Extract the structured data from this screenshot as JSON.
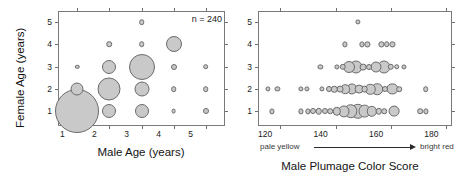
{
  "figure": {
    "background": "#ffffff",
    "bubble_fill": "#c9c9c9",
    "bubble_stroke": "#6b6b6b",
    "axis_color": "#7a7a7a"
  },
  "chart_data": [
    {
      "panel": "left",
      "type": "scatter",
      "bubble": true,
      "title": "",
      "xlabel": "Male Age (years)",
      "ylabel": "Female Age (years)",
      "xlim": [
        0.4,
        5.6
      ],
      "ylim": [
        0.35,
        5.5
      ],
      "xticks": [
        1,
        2,
        3,
        4,
        5
      ],
      "yticks": [
        1,
        2,
        3,
        4,
        5
      ],
      "xticklabels": [
        "1",
        "2",
        "3",
        "4",
        "5"
      ],
      "yticklabels": [
        "1",
        "2",
        "3",
        "4",
        "5"
      ],
      "grid": false,
      "legend": "none",
      "annotations": [
        {
          "text": "n = 240",
          "x": 4.75,
          "y": 5.3
        }
      ],
      "points": [
        {
          "x": 1,
          "y": 1,
          "r": 22.0,
          "n": 58
        },
        {
          "x": 1,
          "y": 2,
          "r": 6.5,
          "n": 6
        },
        {
          "x": 1,
          "y": 3,
          "r": 2.2,
          "n": 1
        },
        {
          "x": 2,
          "y": 1,
          "r": 7.0,
          "n": 7
        },
        {
          "x": 2,
          "y": 2,
          "r": 11.5,
          "n": 18
        },
        {
          "x": 2,
          "y": 3,
          "r": 7.0,
          "n": 7
        },
        {
          "x": 2,
          "y": 4,
          "r": 2.8,
          "n": 1
        },
        {
          "x": 3,
          "y": 1,
          "r": 7.0,
          "n": 7
        },
        {
          "x": 3,
          "y": 2,
          "r": 7.5,
          "n": 8
        },
        {
          "x": 3,
          "y": 3,
          "r": 13.0,
          "n": 22
        },
        {
          "x": 3,
          "y": 4,
          "r": 2.8,
          "n": 1
        },
        {
          "x": 3,
          "y": 5,
          "r": 2.8,
          "n": 1
        },
        {
          "x": 4,
          "y": 1,
          "r": 2.4,
          "n": 1
        },
        {
          "x": 4,
          "y": 2,
          "r": 2.8,
          "n": 1
        },
        {
          "x": 4,
          "y": 3,
          "r": 3.0,
          "n": 2
        },
        {
          "x": 4,
          "y": 4,
          "r": 8.0,
          "n": 9
        },
        {
          "x": 5,
          "y": 1,
          "r": 3.0,
          "n": 2
        },
        {
          "x": 5,
          "y": 2,
          "r": 2.8,
          "n": 1
        },
        {
          "x": 5,
          "y": 3,
          "r": 2.8,
          "n": 1
        }
      ]
    },
    {
      "panel": "right",
      "type": "scatter",
      "bubble": true,
      "title": "",
      "xlabel": "Male Plumage Color Score",
      "ylabel": "",
      "xlim": [
        112,
        182
      ],
      "ylim": [
        0.35,
        5.5
      ],
      "xticks": [
        120,
        140,
        160,
        180
      ],
      "yticks": [
        1,
        2,
        3,
        4,
        5
      ],
      "xticklabels": [
        "120",
        "140",
        "160",
        "180"
      ],
      "yticklabels": [
        "1",
        "2",
        "3",
        "4",
        "5"
      ],
      "grid": false,
      "legend": "none",
      "gradient_legend": {
        "left_label": "pale yellow",
        "right_label": "bright red"
      },
      "points": [
        {
          "x": 148.0,
          "y": 5,
          "r": 2.6
        },
        {
          "x": 143.5,
          "y": 4,
          "r": 2.6
        },
        {
          "x": 149.5,
          "y": 4,
          "r": 2.6
        },
        {
          "x": 151.5,
          "y": 4,
          "r": 2.6
        },
        {
          "x": 156.5,
          "y": 4,
          "r": 2.6
        },
        {
          "x": 158.5,
          "y": 4,
          "r": 2.8
        },
        {
          "x": 160.5,
          "y": 4,
          "r": 2.6
        },
        {
          "x": 134.5,
          "y": 3,
          "r": 2.6
        },
        {
          "x": 140.5,
          "y": 3,
          "r": 2.6
        },
        {
          "x": 142.5,
          "y": 3,
          "r": 3.2
        },
        {
          "x": 145.0,
          "y": 3,
          "r": 6.0
        },
        {
          "x": 147.5,
          "y": 3,
          "r": 6.5
        },
        {
          "x": 150.0,
          "y": 3,
          "r": 3.4
        },
        {
          "x": 152.0,
          "y": 3,
          "r": 3.0
        },
        {
          "x": 154.5,
          "y": 3,
          "r": 5.5
        },
        {
          "x": 157.5,
          "y": 3,
          "r": 6.5
        },
        {
          "x": 160.0,
          "y": 3,
          "r": 3.2
        },
        {
          "x": 162.0,
          "y": 3,
          "r": 2.8
        },
        {
          "x": 164.5,
          "y": 3,
          "r": 2.6
        },
        {
          "x": 115.5,
          "y": 2,
          "r": 2.6
        },
        {
          "x": 119.0,
          "y": 2,
          "r": 2.6
        },
        {
          "x": 127.5,
          "y": 2,
          "r": 2.6
        },
        {
          "x": 129.5,
          "y": 2,
          "r": 2.6
        },
        {
          "x": 135.0,
          "y": 2,
          "r": 2.6
        },
        {
          "x": 137.5,
          "y": 2,
          "r": 3.0
        },
        {
          "x": 139.5,
          "y": 2,
          "r": 3.2
        },
        {
          "x": 141.5,
          "y": 2,
          "r": 3.4
        },
        {
          "x": 143.5,
          "y": 2,
          "r": 4.8
        },
        {
          "x": 146.0,
          "y": 2,
          "r": 5.6
        },
        {
          "x": 148.5,
          "y": 2,
          "r": 4.4
        },
        {
          "x": 150.5,
          "y": 2,
          "r": 3.4
        },
        {
          "x": 152.5,
          "y": 2,
          "r": 5.2
        },
        {
          "x": 155.0,
          "y": 2,
          "r": 5.8
        },
        {
          "x": 158.0,
          "y": 2,
          "r": 3.0
        },
        {
          "x": 160.5,
          "y": 2,
          "r": 5.6
        },
        {
          "x": 163.0,
          "y": 2,
          "r": 2.8
        },
        {
          "x": 172.5,
          "y": 2,
          "r": 2.8
        },
        {
          "x": 117.0,
          "y": 1,
          "r": 2.6
        },
        {
          "x": 127.5,
          "y": 1,
          "r": 2.6
        },
        {
          "x": 130.0,
          "y": 1,
          "r": 2.6
        },
        {
          "x": 132.0,
          "y": 1,
          "r": 3.0
        },
        {
          "x": 134.0,
          "y": 1,
          "r": 3.2
        },
        {
          "x": 136.0,
          "y": 1,
          "r": 3.0
        },
        {
          "x": 138.0,
          "y": 1,
          "r": 2.8
        },
        {
          "x": 140.5,
          "y": 1,
          "r": 4.2
        },
        {
          "x": 143.0,
          "y": 1,
          "r": 5.6
        },
        {
          "x": 145.5,
          "y": 1,
          "r": 6.8
        },
        {
          "x": 148.0,
          "y": 1,
          "r": 7.2
        },
        {
          "x": 150.5,
          "y": 1,
          "r": 6.4
        },
        {
          "x": 153.0,
          "y": 1,
          "r": 5.2
        },
        {
          "x": 155.5,
          "y": 1,
          "r": 3.2
        },
        {
          "x": 157.5,
          "y": 1,
          "r": 2.8
        },
        {
          "x": 161.0,
          "y": 1,
          "r": 5.4
        },
        {
          "x": 170.5,
          "y": 1,
          "r": 2.8
        },
        {
          "x": 172.5,
          "y": 1,
          "r": 2.6
        }
      ]
    }
  ]
}
